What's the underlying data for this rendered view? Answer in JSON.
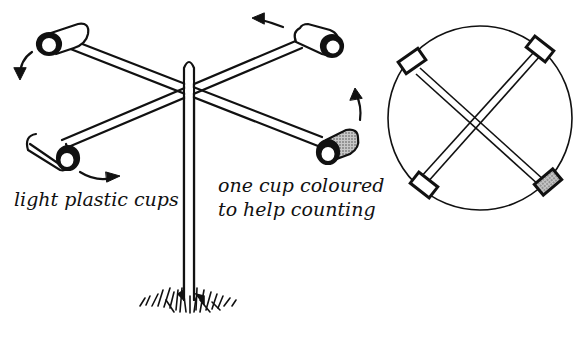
{
  "diagram": {
    "labels": {
      "cups": "light plastic cups",
      "coloured_line1": "one cup coloured",
      "coloured_line2": "to help counting"
    },
    "views": [
      {
        "name": "perspective-view",
        "cups": 4,
        "coloured_cups": 1,
        "rotation_arrows": 4
      },
      {
        "name": "top-view",
        "cups": 4,
        "coloured_cups": 1
      }
    ],
    "colors": {
      "ink": "#111111",
      "background": "#ffffff",
      "coloured_cup_fill": "#8a8a8a"
    }
  }
}
